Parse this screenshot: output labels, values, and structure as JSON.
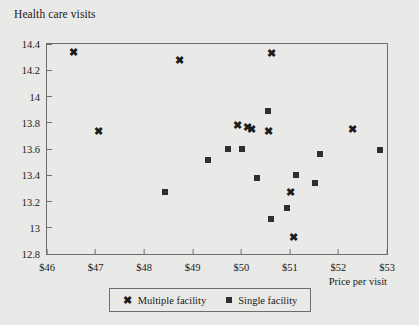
{
  "chart_data": {
    "type": "scatter",
    "title": "Health care visits",
    "xlabel": "Price per visit",
    "ylabel": "Health care visits",
    "xlim": [
      46,
      53
    ],
    "ylim": [
      12.8,
      14.4
    ],
    "grid": false,
    "legend_position": "bottom-center",
    "xticks": [
      "$46",
      "$47",
      "$48",
      "$49",
      "$50",
      "$51",
      "$52",
      "$53"
    ],
    "xtick_values": [
      46,
      47,
      48,
      49,
      50,
      51,
      52,
      53
    ],
    "yticks": [
      "12.8",
      "13",
      "13.2",
      "13.4",
      "13.6",
      "13.8",
      "14",
      "14.2",
      "14.4"
    ],
    "ytick_values": [
      12.8,
      13.0,
      13.2,
      13.4,
      13.6,
      13.8,
      14.0,
      14.2,
      14.4
    ],
    "series": [
      {
        "name": "Multiple facility",
        "marker": "x",
        "color": "#1c1c1c",
        "points": [
          {
            "x": 46.55,
            "y": 14.34
          },
          {
            "x": 47.07,
            "y": 13.74
          },
          {
            "x": 48.72,
            "y": 14.28
          },
          {
            "x": 49.92,
            "y": 13.78
          },
          {
            "x": 50.12,
            "y": 13.77
          },
          {
            "x": 50.22,
            "y": 13.75
          },
          {
            "x": 50.55,
            "y": 13.74
          },
          {
            "x": 50.62,
            "y": 14.33
          },
          {
            "x": 51.02,
            "y": 13.27
          },
          {
            "x": 51.07,
            "y": 12.93
          },
          {
            "x": 52.28,
            "y": 13.75
          }
        ]
      },
      {
        "name": "Single facility",
        "marker": "square",
        "color": "#2f2f2f",
        "points": [
          {
            "x": 48.42,
            "y": 13.27
          },
          {
            "x": 49.32,
            "y": 13.52
          },
          {
            "x": 49.72,
            "y": 13.6
          },
          {
            "x": 50.02,
            "y": 13.6
          },
          {
            "x": 50.32,
            "y": 13.38
          },
          {
            "x": 50.55,
            "y": 13.89
          },
          {
            "x": 50.62,
            "y": 13.07
          },
          {
            "x": 50.95,
            "y": 13.15
          },
          {
            "x": 51.12,
            "y": 13.4
          },
          {
            "x": 51.52,
            "y": 13.34
          },
          {
            "x": 51.62,
            "y": 13.56
          },
          {
            "x": 52.85,
            "y": 13.59
          }
        ]
      }
    ]
  },
  "legend": {
    "items": [
      {
        "label": "Multiple facility",
        "glyph": "x-marker-icon"
      },
      {
        "label": "Single facility",
        "glyph": "square-marker-icon"
      }
    ]
  }
}
